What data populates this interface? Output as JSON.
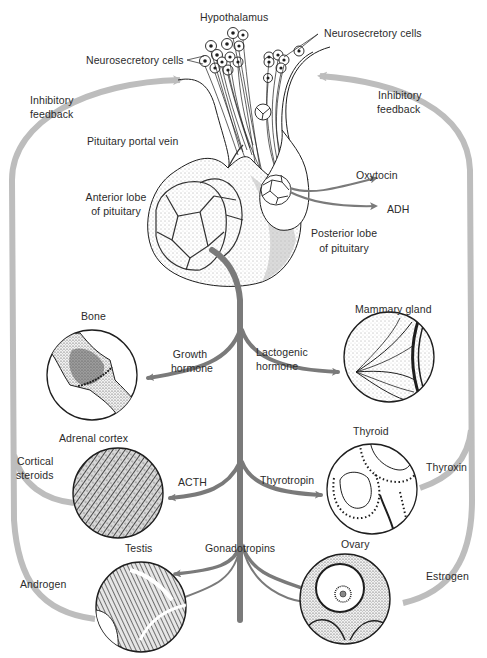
{
  "diagram": {
    "colors": {
      "hormone_path": "#7a7a7a",
      "feedback_path": "#bdbdbd",
      "ink": "#1e1e1e",
      "text": "#2b2b2b",
      "background": "#ffffff"
    },
    "labels": {
      "hypothalamus": "Hypothalamus",
      "neurosecretory_left": "Neurosecretory cells",
      "neurosecretory_right": "Neurosecretory cells",
      "inhibitory_left_1": "Inhibitory",
      "inhibitory_left_2": "feedback",
      "inhibitory_right_1": "Inhibitory",
      "inhibitory_right_2": "feedback",
      "portal_vein": "Pituitary portal vein",
      "anterior_1": "Anterior lobe",
      "anterior_2": "of pituitary",
      "posterior_1": "Posterior lobe",
      "posterior_2": "of pituitary",
      "oxytocin": "Oxytocin",
      "adh": "ADH"
    },
    "targets": [
      {
        "id": "bone",
        "organ": "Bone",
        "hormone_1": "Growth",
        "hormone_2": "hormone"
      },
      {
        "id": "mammary",
        "organ": "Mammary gland",
        "hormone_1": "Lactogenic",
        "hormone_2": "hormone"
      },
      {
        "id": "adrenal",
        "organ": "Adrenal cortex",
        "hormone_1": "ACTH",
        "feedback_1": "Cortical",
        "feedback_2": "steroids"
      },
      {
        "id": "thyroid",
        "organ": "Thyroid",
        "hormone_1": "Thyrotropin",
        "feedback_1": "Thyroxin"
      },
      {
        "id": "testis",
        "organ": "Testis",
        "feedback_1": "Androgen"
      },
      {
        "id": "ovary",
        "organ": "Ovary",
        "feedback_1": "Estrogen"
      }
    ],
    "gonad_hormone": "Gonadotropins"
  }
}
